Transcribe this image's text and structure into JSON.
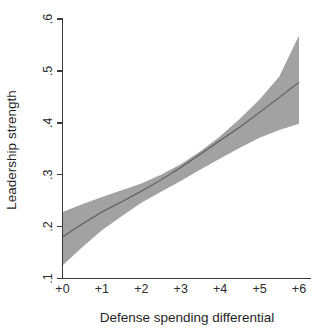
{
  "chart_data": {
    "type": "line",
    "title": "",
    "subtitle": "",
    "xlabel": "Defense spending differential",
    "ylabel": "Leadership strength",
    "xlim": [
      0,
      6
    ],
    "ylim": [
      0.1,
      0.6
    ],
    "grid": false,
    "legend": "none",
    "x_tick_labels": [
      "+0",
      "+1",
      "+2",
      "+3",
      "+4",
      "+5",
      "+6"
    ],
    "x_tick_values": [
      0,
      1,
      2,
      3,
      4,
      5,
      6
    ],
    "y_tick_labels": [
      ".1",
      ".2",
      ".3",
      ".4",
      ".5",
      ".6"
    ],
    "y_tick_values": [
      0.1,
      0.2,
      0.3,
      0.4,
      0.5,
      0.6
    ],
    "x": [
      0,
      0.5,
      1,
      1.5,
      2,
      2.5,
      3,
      3.5,
      4,
      4.5,
      5,
      5.5,
      6
    ],
    "series": [
      {
        "name": "Predicted leadership strength",
        "role": "fit-line",
        "values": [
          0.18,
          0.205,
          0.228,
          0.248,
          0.268,
          0.29,
          0.314,
          0.34,
          0.366,
          0.392,
          0.42,
          0.449,
          0.478
        ]
      },
      {
        "name": "95% confidence interval upper",
        "role": "ci-upper",
        "values": [
          0.228,
          0.243,
          0.257,
          0.27,
          0.283,
          0.3,
          0.32,
          0.345,
          0.374,
          0.408,
          0.445,
          0.489,
          0.568
        ]
      },
      {
        "name": "95% confidence interval lower",
        "role": "ci-lower",
        "values": [
          0.125,
          0.16,
          0.193,
          0.22,
          0.246,
          0.267,
          0.288,
          0.31,
          0.331,
          0.352,
          0.371,
          0.386,
          0.398
        ]
      }
    ],
    "colors": {
      "ci_band": "#a2a2a2",
      "fit_line": "#5b5b5b",
      "axis": "#3a3a3a",
      "text": "#1f1f1f",
      "background": "#ffffff"
    },
    "annotations": []
  },
  "axes": {
    "y_title": "Leadership strength",
    "x_title": "Defense spending differential"
  }
}
